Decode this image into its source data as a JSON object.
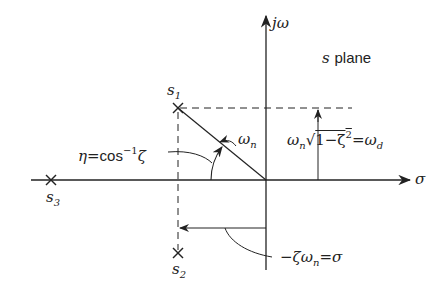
{
  "diagram": {
    "title": "s plane",
    "title_s": "s",
    "title_rest": "plane",
    "axes": {
      "imag_label_j": "j",
      "imag_label_omega": "ω",
      "real_label": "σ"
    },
    "poles": [
      {
        "name": "s",
        "sub": "1",
        "x": 178,
        "y": 108
      },
      {
        "name": "s",
        "sub": "2",
        "x": 178,
        "y": 253
      },
      {
        "name": "s",
        "sub": "3",
        "x": 51,
        "y": 180
      }
    ],
    "annotations": {
      "angle_lhs": "η",
      "angle_eq": "=",
      "angle_cos": "cos",
      "angle_sup": "−1",
      "angle_zeta": "ζ",
      "natural_freq_omega": "ω",
      "natural_freq_sub": "n",
      "damped_omega": "ω",
      "damped_sub": "n",
      "damped_sqrt": "√",
      "damped_inner": "1−ζ",
      "damped_sq": "2",
      "damped_eq": "=",
      "damped_rhs": "ω",
      "damped_rhs_sub": "d",
      "sigma_minus": "−ζω",
      "sigma_sub": "n",
      "sigma_eq": "=",
      "sigma_rhs": "σ"
    }
  }
}
